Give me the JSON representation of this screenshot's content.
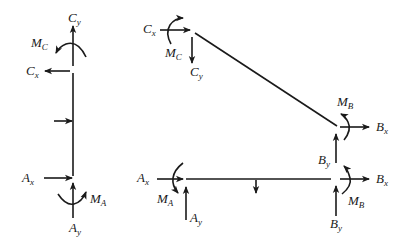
{
  "diagram": {
    "type": "free-body-diagram",
    "left_member": {
      "labels": {
        "Cy": {
          "main": "C",
          "sub": "y"
        },
        "Mc": {
          "main": "M",
          "sub": "C"
        },
        "Cx": {
          "main": "C",
          "sub": "x"
        },
        "Ax": {
          "main": "A",
          "sub": "x"
        },
        "MA": {
          "main": "M",
          "sub": "A"
        },
        "Ay": {
          "main": "A",
          "sub": "y"
        }
      }
    },
    "frame_member": {
      "labels": {
        "Cx": {
          "main": "C",
          "sub": "x"
        },
        "Mc": {
          "main": "M",
          "sub": "C"
        },
        "Cy": {
          "main": "C",
          "sub": "y"
        },
        "MB": {
          "main": "M",
          "sub": "B"
        },
        "Bx": {
          "main": "B",
          "sub": "x"
        },
        "By": {
          "main": "B",
          "sub": "y"
        }
      }
    },
    "beam_member": {
      "labels": {
        "Ax": {
          "main": "A",
          "sub": "x"
        },
        "MA": {
          "main": "M",
          "sub": "A"
        },
        "Ay": {
          "main": "A",
          "sub": "y"
        },
        "Bx": {
          "main": "B",
          "sub": "x"
        },
        "MB": {
          "main": "M",
          "sub": "B"
        },
        "By": {
          "main": "B",
          "sub": "y"
        }
      }
    },
    "colors": {
      "ink": "#1a1a1a",
      "background": "#ffffff"
    }
  }
}
